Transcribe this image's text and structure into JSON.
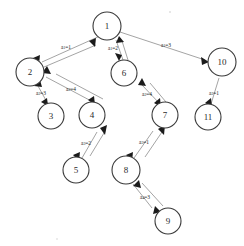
{
  "diagram": {
    "type": "directed-graph",
    "colors": {
      "background": "#ffffff",
      "node_stroke": "#3a3a3a",
      "node_fill": "#ffffff",
      "edge_stroke": "#9a9a9a",
      "arrowhead": "#1b1b1b",
      "text": "#2b2b2b"
    },
    "nodes": [
      {
        "id": "1",
        "label": "1",
        "cx": 107,
        "cy": 26,
        "r": 14
      },
      {
        "id": "2",
        "label": "2",
        "cx": 30,
        "cy": 72,
        "r": 14
      },
      {
        "id": "3",
        "label": "3",
        "cx": 51,
        "cy": 116,
        "r": 13
      },
      {
        "id": "4",
        "label": "4",
        "cx": 92,
        "cy": 115,
        "r": 13
      },
      {
        "id": "5",
        "label": "5",
        "cx": 76,
        "cy": 170,
        "r": 13
      },
      {
        "id": "6",
        "label": "6",
        "cx": 124,
        "cy": 73,
        "r": 13
      },
      {
        "id": "7",
        "label": "7",
        "cx": 165,
        "cy": 115,
        "r": 13
      },
      {
        "id": "8",
        "label": "8",
        "cx": 126,
        "cy": 170,
        "r": 14
      },
      {
        "id": "9",
        "label": "9",
        "cx": 168,
        "cy": 221,
        "r": 13
      },
      {
        "id": "10",
        "label": "10",
        "cx": 222,
        "cy": 62,
        "r": 14
      },
      {
        "id": "11",
        "label": "11",
        "cx": 208,
        "cy": 117,
        "r": 13
      }
    ],
    "edges": [
      {
        "id": "e-2-1",
        "from": "2",
        "to": "1",
        "label_var": "a",
        "label_sub": "1",
        "label_value": "1",
        "label": "a₁=1",
        "lx": 66,
        "ly": 47
      },
      {
        "id": "e-6-1",
        "from": "6",
        "to": "1",
        "label_var": "a",
        "label_sub": "1",
        "label_value": "2",
        "label": "a₁=2",
        "lx": 114,
        "ly": 48
      },
      {
        "id": "e-1-10",
        "from": "1",
        "to": "10",
        "label_var": "a",
        "label_sub": "1",
        "label_value": "3",
        "label": "a₁=3",
        "lx": 165,
        "ly": 45
      },
      {
        "id": "e-3-2",
        "from": "3",
        "to": "2",
        "label_var": "a",
        "label_sub": "2",
        "label_value": "3",
        "label": "a₂=3",
        "lx": 41,
        "ly": 92
      },
      {
        "id": "e-4-2",
        "from": "4",
        "to": "2",
        "label_var": "a",
        "label_sub": "2",
        "label_value": "4",
        "label": "a₂=4",
        "lx": 70,
        "ly": 89
      },
      {
        "id": "e-7-6",
        "from": "7",
        "to": "6",
        "label_var": "a",
        "label_sub": "2",
        "label_value": "4",
        "label": "a₂=4",
        "lx": 147,
        "ly": 94
      },
      {
        "id": "e-11-10",
        "from": "11",
        "to": "10",
        "label_var": "a",
        "label_sub": "2",
        "label_value": "1",
        "label": "a₂=1",
        "lx": 213,
        "ly": 93
      },
      {
        "id": "e-5-4",
        "from": "5",
        "to": "4",
        "label_var": "a",
        "label_sub": "3",
        "label_value": "2",
        "label": "a₃=2",
        "lx": 85,
        "ly": 143
      },
      {
        "id": "e-8-7",
        "from": "8",
        "to": "7",
        "label_var": "a",
        "label_sub": "3",
        "label_value": "1",
        "label": "a₃=1",
        "lx": 144,
        "ly": 142
      },
      {
        "id": "e-9-8",
        "from": "9",
        "to": "8",
        "label_var": "a",
        "label_sub": "4",
        "label_value": "3",
        "label": "a₄=3",
        "lx": 144,
        "ly": 196
      }
    ]
  }
}
